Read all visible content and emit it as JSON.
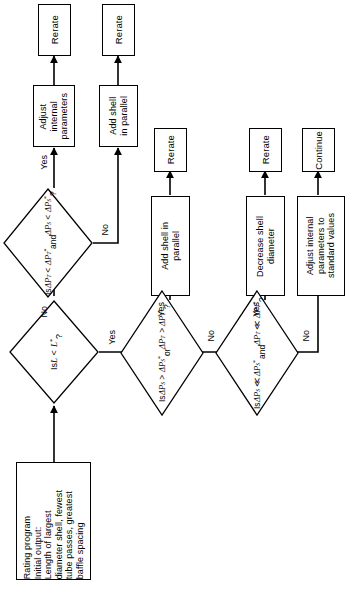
{
  "diagram": {
    "orientation": "rotated-90-ccw",
    "colors": {
      "stroke": "#000000",
      "fill": "#ffffff",
      "background": "#ffffff"
    },
    "nodes": {
      "start": {
        "id": "start",
        "shape": "process",
        "label": "Rating program\nInitial output:\nLength of largest\ndiameter shell, fewest\ntube passes, greatest\nbaffle spacing"
      },
      "d_length": {
        "id": "d_length",
        "shape": "decision",
        "label_line1": "Is",
        "label_line2": "L < L*",
        "label_line3": "?"
      },
      "d_dp_over": {
        "id": "d_dp_over",
        "shape": "decision",
        "label_line1": "Is",
        "label_line2": "ΔP_S > ΔP_S*",
        "label_line3": "or",
        "label_line4": "ΔP_T > ΔP_T*",
        "label_line5": "?"
      },
      "d_dp_much_less": {
        "id": "d_dp_much_less",
        "shape": "decision",
        "label_line1": "Is",
        "label_line2": "ΔP_S ≪ ΔP_S*",
        "label_line3": "and",
        "label_line4": "ΔP_T ≪ ΔP_T*",
        "label_line5": "?"
      },
      "d_dp_less": {
        "id": "d_dp_less",
        "shape": "decision",
        "label_line1": "Is",
        "label_line2": "ΔP_T < ΔP_T*",
        "label_line3": "and",
        "label_line4": "ΔP_S < ΔP_S*",
        "label_line5": "?"
      },
      "adjust_internal": {
        "id": "adjust_internal",
        "shape": "process",
        "label": "Adjust\ninternal\nparameters"
      },
      "add_shell_parallel_top": {
        "id": "add_shell_parallel_top",
        "shape": "process",
        "label": "Add shell\nin parallel"
      },
      "add_shell_parallel_mid": {
        "id": "add_shell_parallel_mid",
        "shape": "process",
        "label": "Add shell in\nparallel"
      },
      "decrease_shell_diameter": {
        "id": "decrease_shell_diameter",
        "shape": "process",
        "label": "Decrease shell\ndiameter"
      },
      "adjust_standard": {
        "id": "adjust_standard",
        "shape": "process",
        "label": "Adjust internal\nparameters to\nstandard values"
      },
      "rerate_1": {
        "id": "rerate_1",
        "shape": "terminal",
        "label": "Rerate"
      },
      "rerate_2": {
        "id": "rerate_2",
        "shape": "terminal",
        "label": "Rerate"
      },
      "rerate_3": {
        "id": "rerate_3",
        "shape": "terminal",
        "label": "Rerate"
      },
      "rerate_4": {
        "id": "rerate_4",
        "shape": "terminal",
        "label": "Rerate"
      },
      "continue": {
        "id": "continue",
        "shape": "terminal",
        "label": "Continue"
      }
    },
    "edge_labels": {
      "length_no": "No",
      "length_yes": "Yes",
      "dp_over_yes": "Yes",
      "dp_over_no": "No",
      "much_less_yes": "Yes",
      "much_less_no": "No",
      "dp_less_yes": "Yes",
      "dp_less_no": "No"
    },
    "edges": [
      {
        "from": "start",
        "to": "d_length",
        "label": ""
      },
      {
        "from": "d_length",
        "to": "d_dp_less",
        "label": "No"
      },
      {
        "from": "d_length",
        "to": "d_dp_over",
        "label": "Yes"
      },
      {
        "from": "d_dp_less",
        "to": "adjust_internal",
        "label": "Yes"
      },
      {
        "from": "d_dp_less",
        "to": "add_shell_parallel_top",
        "label": "No"
      },
      {
        "from": "adjust_internal",
        "to": "rerate_1",
        "label": ""
      },
      {
        "from": "add_shell_parallel_top",
        "to": "rerate_2",
        "label": ""
      },
      {
        "from": "d_dp_over",
        "to": "add_shell_parallel_mid",
        "label": "Yes"
      },
      {
        "from": "d_dp_over",
        "to": "d_dp_much_less",
        "label": "No"
      },
      {
        "from": "add_shell_parallel_mid",
        "to": "rerate_3",
        "label": ""
      },
      {
        "from": "d_dp_much_less",
        "to": "decrease_shell_diameter",
        "label": "Yes"
      },
      {
        "from": "d_dp_much_less",
        "to": "adjust_standard",
        "label": "No"
      },
      {
        "from": "decrease_shell_diameter",
        "to": "rerate_4",
        "label": ""
      },
      {
        "from": "adjust_standard",
        "to": "continue",
        "label": ""
      }
    ]
  }
}
